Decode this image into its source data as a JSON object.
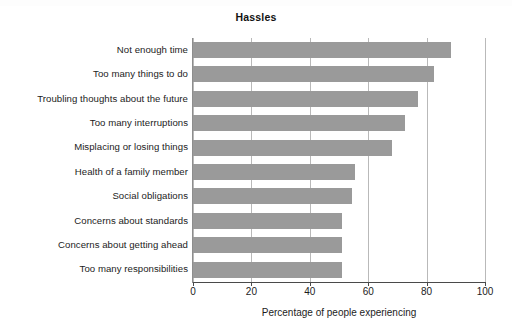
{
  "chart_data": {
    "type": "bar",
    "orientation": "horizontal",
    "title": "Hassles",
    "xlabel": "Percentage of people experiencing",
    "ylabel": "",
    "categories": [
      "Not enough time",
      "Too many things to do",
      "Troubling thoughts about the future",
      "Too many interruptions",
      "Misplacing or losing things",
      "Health of a family member",
      "Social obligations",
      "Concerns about standards",
      "Concerns about getting ahead",
      "Too many responsibilities"
    ],
    "values": [
      88.5,
      82.5,
      77,
      72.5,
      68,
      55.5,
      54.5,
      51,
      51,
      51
    ],
    "xlim": [
      0,
      100
    ],
    "xticks": [
      0,
      20,
      40,
      60,
      80,
      100
    ],
    "xtick_labels": [
      "0",
      "20",
      "40",
      "60",
      "80",
      "100"
    ],
    "grid": "vertical",
    "legend": "none",
    "bar_color": "#9a9a9a",
    "gridline_color": "#b9b9b9",
    "axis_color": "#4a4a4a",
    "background_color": "#ffffff"
  }
}
